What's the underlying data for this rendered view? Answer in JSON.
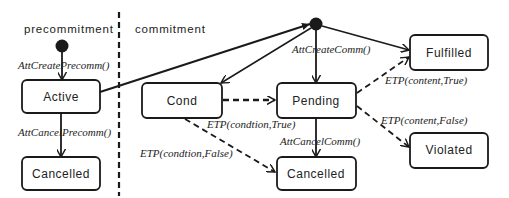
{
  "regions": {
    "precommitment": "precommitment",
    "commitment": "commitment"
  },
  "states": {
    "active": "Active",
    "precomm_cancelled": "Cancelled",
    "cond": "Cond",
    "pending": "Pending",
    "comm_cancelled": "Cancelled",
    "fulfilled": "Fulfilled",
    "violated": "Violated"
  },
  "transitions": {
    "att_create_precomm": "AttCreatePrecomm()",
    "att_cancel_precomm": "AttCancelPrecomm()",
    "att_create_comm": "AttCreateComm()",
    "etp_condition_true": "ETP(condtion,True)",
    "etp_condition_false": "ETP(condtion,False)",
    "att_cancel_comm": "AttCancelComm()",
    "etp_content_true": "ETP(content,True)",
    "etp_content_false": "ETP(content,False)"
  },
  "colors": {
    "stroke": "#1a1a1a",
    "background": "#ffffff"
  }
}
